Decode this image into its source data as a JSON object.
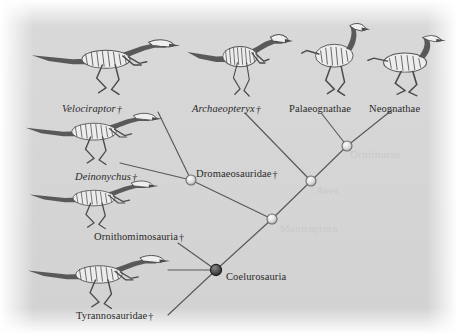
{
  "figure": {
    "background_color": "#d6d6d6",
    "line_color": "#585858",
    "faint_label_color": "#c9c9c9",
    "dagger": "†"
  },
  "tips": [
    {
      "id": "velociraptor",
      "label": "Velociraptor",
      "italic": true,
      "extinct": true,
      "x": 62,
      "y": 103
    },
    {
      "id": "archaeopteryx",
      "label": "Archaeopteryx",
      "italic": true,
      "extinct": true,
      "x": 192,
      "y": 103
    },
    {
      "id": "palaeognathae",
      "label": "Palaeognathae",
      "italic": false,
      "extinct": false,
      "x": 289,
      "y": 103
    },
    {
      "id": "neognathae",
      "label": "Neognathae",
      "italic": false,
      "extinct": false,
      "x": 369,
      "y": 103
    },
    {
      "id": "deinonychus",
      "label": "Deinonychus",
      "italic": true,
      "extinct": true,
      "x": 75,
      "y": 171
    },
    {
      "id": "ornithomimosauria",
      "label": "Ornithomimosauria",
      "italic": false,
      "extinct": true,
      "x": 94,
      "y": 231
    },
    {
      "id": "tyrannosauridae",
      "label": "Tyrannosauridae",
      "italic": false,
      "extinct": true,
      "x": 76,
      "y": 310
    }
  ],
  "clades": [
    {
      "id": "dromaeosauridae",
      "label": "Dromaeosauridae",
      "extinct": true,
      "faint": false,
      "x": 196,
      "y": 168
    },
    {
      "id": "coelurosauria",
      "label": "Coelurosauria",
      "extinct": false,
      "faint": false,
      "x": 226,
      "y": 271
    },
    {
      "id": "ornithurae",
      "label": "Ornithurae",
      "extinct": false,
      "faint": true,
      "x": 350,
      "y": 148
    },
    {
      "id": "aves",
      "label": "Aves",
      "extinct": false,
      "faint": true,
      "x": 316,
      "y": 184
    },
    {
      "id": "maniraptora",
      "label": "Maniraptora",
      "extinct": false,
      "faint": true,
      "x": 280,
      "y": 222
    }
  ],
  "nodes": [
    {
      "id": "node-dromaeosauridae",
      "x": 191,
      "y": 180,
      "r": 5.0,
      "filled": false
    },
    {
      "id": "node-aves",
      "x": 311,
      "y": 181,
      "r": 5.0,
      "filled": false
    },
    {
      "id": "node-ornithurae",
      "x": 347,
      "y": 146,
      "r": 5.0,
      "filled": false
    },
    {
      "id": "node-maniraptora",
      "x": 272,
      "y": 219,
      "r": 5.0,
      "filled": false
    },
    {
      "id": "node-coelurosauria",
      "x": 216,
      "y": 270,
      "r": 5.6,
      "filled": true
    }
  ],
  "branches": [
    {
      "id": "branch-velociraptor",
      "x1": 191,
      "y1": 180,
      "x2": 158,
      "y2": 112
    },
    {
      "id": "branch-deinonychus",
      "x1": 191,
      "y1": 180,
      "x2": 120,
      "y2": 163
    },
    {
      "id": "branch-dromaeo-to-manirap",
      "x1": 191,
      "y1": 180,
      "x2": 272,
      "y2": 219
    },
    {
      "id": "branch-archaeopteryx",
      "x1": 311,
      "y1": 181,
      "x2": 245,
      "y2": 113
    },
    {
      "id": "branch-aves-to-ornithurae",
      "x1": 311,
      "y1": 181,
      "x2": 347,
      "y2": 146
    },
    {
      "id": "branch-aves-to-manirap",
      "x1": 311,
      "y1": 181,
      "x2": 272,
      "y2": 219
    },
    {
      "id": "branch-palaeognathae",
      "x1": 347,
      "y1": 146,
      "x2": 322,
      "y2": 114
    },
    {
      "id": "branch-neognathae",
      "x1": 347,
      "y1": 146,
      "x2": 392,
      "y2": 110
    },
    {
      "id": "branch-manirap-to-coelur",
      "x1": 272,
      "y1": 219,
      "x2": 216,
      "y2": 270
    },
    {
      "id": "branch-ornithomimosauria",
      "x1": 216,
      "y1": 270,
      "x2": 178,
      "y2": 243
    },
    {
      "id": "branch-coelur-stub",
      "x1": 216,
      "y1": 270,
      "x2": 168,
      "y2": 270
    },
    {
      "id": "branch-tyrannosauridae",
      "x1": 216,
      "y1": 270,
      "x2": 168,
      "y2": 315
    }
  ],
  "skeletons": [
    {
      "id": "skeleton-velociraptor",
      "taxon": "Velociraptor",
      "x": 30,
      "y": 34,
      "w": 152,
      "h": 62,
      "flip": false
    },
    {
      "id": "skeleton-archaeopteryx",
      "taxon": "Archaeopteryx",
      "x": 186,
      "y": 28,
      "w": 108,
      "h": 70,
      "flip": false
    },
    {
      "id": "skeleton-palaeognathae",
      "taxon": "Palaeognathae",
      "x": 300,
      "y": 24,
      "w": 72,
      "h": 74,
      "flip": false
    },
    {
      "id": "skeleton-neognathae",
      "taxon": "Neognathae",
      "x": 366,
      "y": 36,
      "w": 82,
      "h": 62,
      "flip": false
    },
    {
      "id": "skeleton-deinonychus",
      "taxon": "Deinonychus",
      "x": 24,
      "y": 108,
      "w": 140,
      "h": 58,
      "flip": false
    },
    {
      "id": "skeleton-ornithomimosauria",
      "taxon": "Ornithomimosauria",
      "x": 28,
      "y": 176,
      "w": 132,
      "h": 54,
      "flip": false
    },
    {
      "id": "skeleton-tyrannosauridae",
      "taxon": "Tyrannosauridae",
      "x": 26,
      "y": 250,
      "w": 146,
      "h": 60,
      "flip": false
    }
  ]
}
